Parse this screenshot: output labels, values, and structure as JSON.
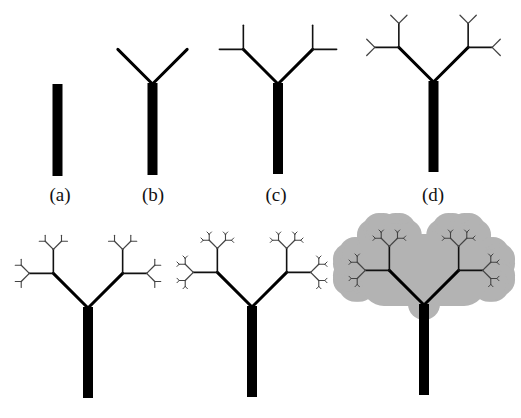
{
  "figure": {
    "colors": {
      "background": "#ffffff",
      "trunk": "#000000",
      "branch": "#111111",
      "fine_branch": "#444444",
      "canopy": "#b3b3b3"
    },
    "trunk_width": 10,
    "branch_angle_deg": 45,
    "branch_lengths": [
      49,
      24,
      11.5,
      6,
      3.2
    ],
    "branch_widths": [
      3,
      1.6,
      1.3,
      1.1,
      1.0
    ],
    "panels": [
      {
        "id": "a",
        "label": "(a)",
        "label_x": 60,
        "label_y": 184,
        "base_x": 57.5,
        "base_y": 176,
        "trunk_height": 92,
        "depth": 0,
        "canopy": false
      },
      {
        "id": "b",
        "label": "(b)",
        "label_x": 153,
        "label_y": 184,
        "base_x": 152.5,
        "base_y": 175,
        "trunk_height": 92,
        "depth": 1,
        "canopy": false
      },
      {
        "id": "c",
        "label": "(c)",
        "label_x": 276,
        "label_y": 184,
        "base_x": 278,
        "base_y": 174,
        "trunk_height": 91,
        "depth": 2,
        "canopy": false
      },
      {
        "id": "d",
        "label": "(d)",
        "label_x": 433,
        "label_y": 184,
        "base_x": 433.5,
        "base_y": 172,
        "trunk_height": 91,
        "depth": 3,
        "canopy": false
      },
      {
        "id": "e",
        "label": "",
        "base_x": 88,
        "base_y": 398,
        "trunk_height": 91,
        "depth": 4,
        "canopy": false
      },
      {
        "id": "f",
        "label": "",
        "base_x": 252,
        "base_y": 397,
        "trunk_height": 91,
        "depth": 5,
        "canopy": false
      },
      {
        "id": "g",
        "label": "",
        "base_x": 424,
        "base_y": 395,
        "trunk_height": 91,
        "depth": 5,
        "canopy": true
      }
    ]
  }
}
